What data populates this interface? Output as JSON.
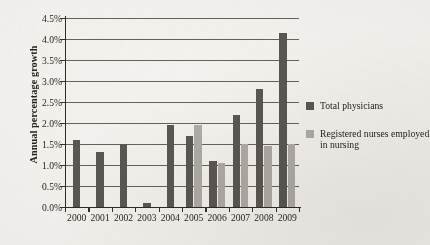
{
  "chart_data": {
    "type": "bar",
    "title": "",
    "xlabel": "",
    "ylabel": "Annual percentage growth",
    "categories": [
      "2000",
      "2001",
      "2002",
      "2003",
      "2004",
      "2005",
      "2006",
      "2007",
      "2008",
      "2009"
    ],
    "ylim": [
      0,
      4.5
    ],
    "ytick_step": 0.5,
    "ytick_labels": [
      "0.0%",
      "0.5%",
      "1.0%",
      "1.5%",
      "2.0%",
      "2.5%",
      "3.0%",
      "3.5%",
      "4.0%",
      "4.5%"
    ],
    "grid": true,
    "grid_axis": "y",
    "legend_position": "right",
    "value_suffix": "%",
    "series": [
      {
        "name": "Total physicians",
        "color": "#5b5854",
        "values": [
          1.6,
          1.3,
          1.5,
          0.1,
          1.95,
          1.7,
          1.1,
          2.2,
          2.8,
          4.15
        ]
      },
      {
        "name": "Registered nurses employed in nursing",
        "color": "#b0aca6",
        "values": [
          null,
          null,
          null,
          null,
          null,
          1.95,
          1.05,
          1.5,
          1.45,
          1.5
        ]
      }
    ]
  },
  "legend": {
    "items": [
      {
        "label": "Total physicians",
        "color": "#5b5854"
      },
      {
        "label": "Registered nurses employed in nursing",
        "color": "#b0aca6"
      }
    ]
  }
}
